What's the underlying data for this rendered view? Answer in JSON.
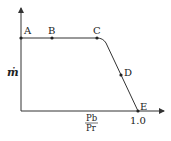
{
  "diagram": {
    "type": "flow-rate-vs-pressure-ratio",
    "y_axis_label": "ṁ",
    "x_axis_label": {
      "numerator": "Pb",
      "denominator": "Pr"
    },
    "x_tick_label": "1.0",
    "points": [
      {
        "label": "A",
        "x": 21,
        "y": 38
      },
      {
        "label": "B",
        "x": 52,
        "y": 38
      },
      {
        "label": "C",
        "x": 97,
        "y": 38
      },
      {
        "label": "D",
        "x": 121,
        "y": 75
      },
      {
        "label": "E",
        "x": 138,
        "y": 111
      }
    ],
    "colors": {
      "line": "#333333",
      "background": "#ffffff"
    }
  }
}
